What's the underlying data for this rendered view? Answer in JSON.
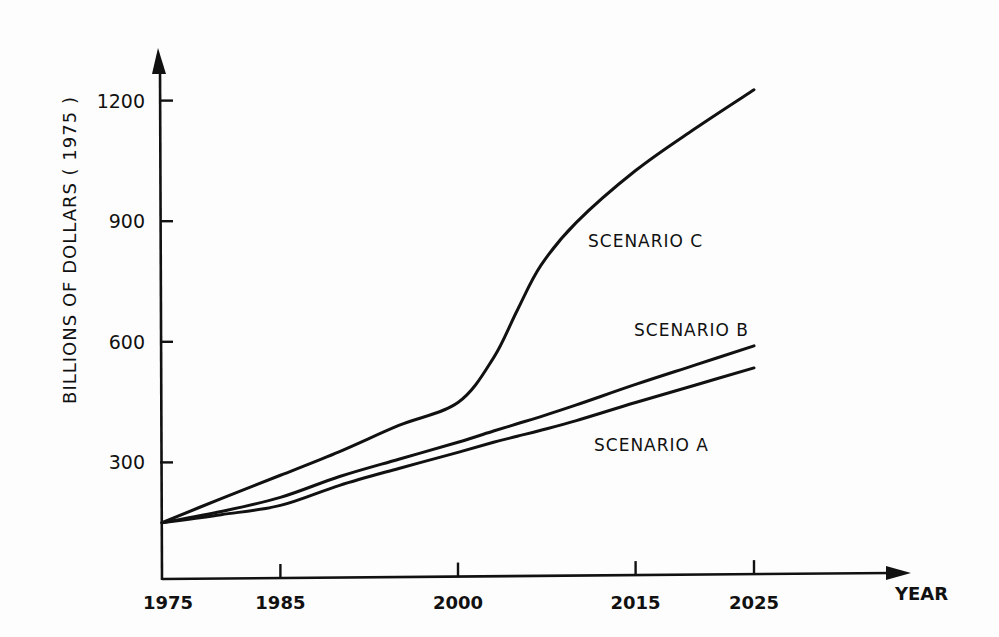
{
  "chart_data": {
    "type": "line",
    "title": "",
    "xlabel": "YEAR",
    "ylabel": "BILLIONS OF DOLLARS ( 1975 )",
    "xlim": [
      1975,
      2040
    ],
    "ylim": [
      0,
      1300
    ],
    "grid": false,
    "legend": "inline labels",
    "x_ticks": [
      1975,
      1985,
      2000,
      2015,
      2025
    ],
    "x_tick_labels": [
      "1975",
      "1985",
      "2000",
      "2015",
      "2025"
    ],
    "y_ticks": [
      300,
      600,
      900,
      1200
    ],
    "y_tick_labels": [
      "300",
      "600",
      "900",
      "1200"
    ],
    "x": [
      1975,
      1980,
      1985,
      1990,
      1995,
      2000,
      2003,
      2005,
      2007,
      2010,
      2015,
      2020,
      2025
    ],
    "series": [
      {
        "name": "SCENARIO A",
        "values": [
          150,
          170,
          193,
          243,
          285,
          325,
          350,
          365,
          380,
          404,
          449,
          492,
          535
        ]
      },
      {
        "name": "SCENARIO B",
        "values": [
          150,
          178,
          213,
          265,
          308,
          350,
          378,
          396,
          414,
          443,
          494,
          542,
          590
        ]
      },
      {
        "name": "SCENARIO C",
        "values": [
          150,
          210,
          268,
          327,
          392,
          449,
          560,
          678,
          790,
          897,
          1026,
          1130,
          1227
        ]
      }
    ],
    "annotations": [
      {
        "text": "SCENARIO C",
        "x_px": 588,
        "y_px": 247
      },
      {
        "text": "SCENARIO B",
        "x_px": 634,
        "y_px": 336
      },
      {
        "text": "SCENARIO A",
        "x_px": 594,
        "y_px": 451
      }
    ]
  },
  "layout": {
    "x_px_per_year": 11.84,
    "x_origin_px": 162,
    "y_zero_px": 583,
    "y_px_per_unit": 0.402
  }
}
